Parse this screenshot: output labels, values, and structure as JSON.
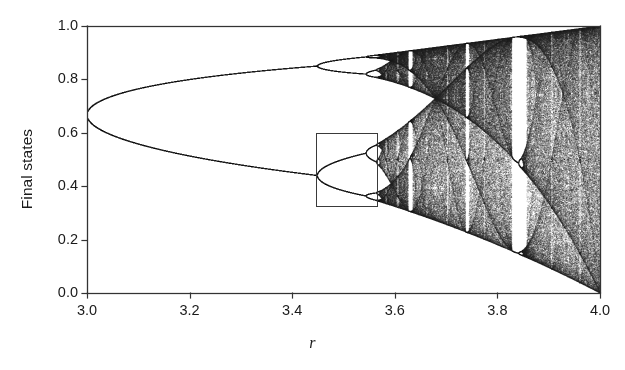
{
  "figure": {
    "background_color": "#ffffff",
    "ink_color": "#1a1a1a",
    "width": 625,
    "height": 370
  },
  "axes": {
    "left_px": 87,
    "right_px": 600,
    "top_px": 26,
    "bottom_px": 293,
    "frame_color": "#333333",
    "line_width": 1.3
  },
  "chart_data": {
    "type": "scatter",
    "title": "",
    "subtitle": "",
    "xlabel": "r",
    "ylabel": "Final states",
    "xlim": [
      3.0,
      4.0
    ],
    "ylim": [
      0.0,
      1.0
    ],
    "grid": false,
    "legend": null,
    "xticks": [
      3.0,
      3.2,
      3.4,
      3.6,
      3.8,
      4.0
    ],
    "xticklabels": [
      "3.0",
      "3.2",
      "3.4",
      "3.6",
      "3.8",
      "4.0"
    ],
    "yticks": [
      0.0,
      0.2,
      0.4,
      0.6,
      0.8,
      1.0
    ],
    "yticklabels": [
      "0.0",
      "0.2",
      "0.4",
      "0.6",
      "0.8",
      "1.0"
    ],
    "map": {
      "equation": "x_next = r * x * (1 - x)",
      "x0": 0.35,
      "transient_iterations": 350,
      "plotted_iterations": 260,
      "r_samples": 2100,
      "point_color": "#262626",
      "point_alpha": 0.3,
      "point_size_px": 0.85
    },
    "annotations": [
      {
        "name": "inset-region-box",
        "type": "rectangle",
        "x_range": [
          3.4465,
          3.5655
        ],
        "y_range": [
          0.3255,
          0.5975
        ],
        "stroke": "#3a3a3a",
        "line_width": 1.0,
        "fill": "none"
      }
    ],
    "features": [
      {
        "label": "period-1 fixed point branch",
        "r_range": [
          3.0,
          3.0
        ],
        "value": 0.6667
      },
      {
        "label": "first period-doubling (period 2)",
        "r": 3.0
      },
      {
        "label": "second period-doubling (period 4)",
        "r": 3.449
      },
      {
        "label": "third period-doubling (period 8)",
        "r": 3.544
      },
      {
        "label": "accumulation point (onset of chaos)",
        "r": 3.5699
      },
      {
        "label": "period-3 window",
        "r_range": [
          3.828,
          3.857
        ]
      },
      {
        "label": "period-5 window",
        "r_range": [
          3.738,
          3.745
        ]
      },
      {
        "label": "period-6 window",
        "r_range": [
          3.626,
          3.635
        ]
      }
    ]
  },
  "labels": {
    "ylabel_text": "Final states",
    "xlabel_text": "r"
  }
}
